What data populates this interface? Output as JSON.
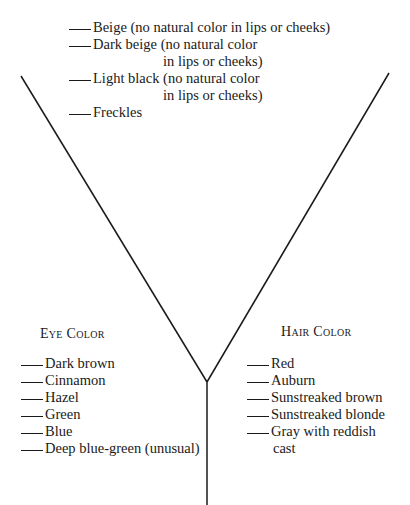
{
  "skin_list": {
    "items": [
      {
        "label": "Beige (no natural color in lips or cheeks)",
        "continuation": ""
      },
      {
        "label": "Dark beige (no natural color",
        "continuation": "in lips or cheeks)"
      },
      {
        "label": "Light black (no natural color",
        "continuation": "in lips or cheeks)"
      },
      {
        "label": "Freckles",
        "continuation": ""
      }
    ]
  },
  "eye_color": {
    "heading": "Eye Color",
    "items": [
      "Dark brown",
      "Cinnamon",
      "Hazel",
      "Green",
      "Blue",
      "Deep blue-green (unusual)"
    ]
  },
  "hair_color": {
    "heading": "Hair Color",
    "items": [
      {
        "label": "Red",
        "continuation": ""
      },
      {
        "label": "Auburn",
        "continuation": ""
      },
      {
        "label": "Sunstreaked brown",
        "continuation": ""
      },
      {
        "label": "Sunstreaked blonde",
        "continuation": ""
      },
      {
        "label": "Gray with reddish",
        "continuation": "cast"
      }
    ]
  },
  "colors": {
    "ink": "#1a1a1a",
    "background": "#ffffff"
  }
}
